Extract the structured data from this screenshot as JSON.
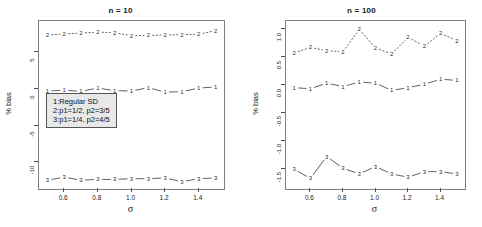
{
  "figure": {
    "ylabel": "% bias",
    "xlabel": "σ",
    "legend": {
      "lines": [
        "1:Regular SD",
        "2:p1=1/2, p2=3/5",
        "3:p1=1/4, p2=4/5"
      ]
    }
  },
  "chart_data": [
    {
      "type": "line",
      "title": "n = 10",
      "xlabel": "σ",
      "ylabel": "% bias",
      "xlim": [
        0.45,
        1.55
      ],
      "ylim": [
        -13.6,
        9.2
      ],
      "xticks": [
        0.6,
        0.8,
        1.0,
        1.2,
        1.4
      ],
      "xticklabels": [
        "0.6",
        "0.8",
        "1.0",
        "1.2",
        "1.4"
      ],
      "yticks": [
        5,
        0,
        -5,
        -10
      ],
      "yticklabels": [
        "5",
        "0",
        "-5",
        "-10"
      ],
      "grid": false,
      "legend_position": "center",
      "x": [
        0.5,
        0.6,
        0.7,
        0.8,
        0.9,
        1.0,
        1.1,
        1.2,
        1.3,
        1.4,
        1.5
      ],
      "series": [
        {
          "name": "1",
          "marker": "1",
          "linestyle": "solid",
          "values": [
            -0.3,
            -0.2,
            -0.35,
            0.1,
            -0.25,
            -0.3,
            0.15,
            -0.45,
            -0.4,
            0.1,
            0.25
          ]
        },
        {
          "name": "2",
          "marker": "2",
          "linestyle": "dashed",
          "values": [
            7.3,
            7.45,
            7.55,
            7.7,
            7.6,
            7.2,
            7.25,
            7.3,
            7.35,
            7.4,
            7.9
          ]
        },
        {
          "name": "3",
          "marker": "3",
          "linestyle": "solid",
          "values": [
            -12.4,
            -12.0,
            -12.4,
            -12.3,
            -12.3,
            -12.2,
            -12.2,
            -12.1,
            -12.6,
            -12.2,
            -12.1
          ]
        }
      ]
    },
    {
      "type": "line",
      "title": "n = 100",
      "xlabel": "σ",
      "ylabel": "% bias",
      "xlim": [
        0.45,
        1.55
      ],
      "ylim": [
        -1.85,
        1.15
      ],
      "xticks": [
        0.6,
        0.8,
        1.0,
        1.2,
        1.4
      ],
      "xticklabels": [
        "0.6",
        "0.8",
        "1.0",
        "1.2",
        "1.4"
      ],
      "yticks": [
        1.0,
        0.5,
        0.0,
        -0.5,
        -1.0,
        -1.5
      ],
      "yticklabels": [
        "1.0",
        "0.5",
        "0.0",
        "-0.5",
        "-1.0",
        "-1.5"
      ],
      "grid": false,
      "legend_position": "none",
      "x": [
        0.5,
        0.6,
        0.7,
        0.8,
        0.9,
        1.0,
        1.1,
        1.2,
        1.3,
        1.4,
        1.5
      ],
      "series": [
        {
          "name": "1",
          "marker": "1",
          "linestyle": "solid",
          "values": [
            -0.04,
            -0.06,
            0.04,
            -0.02,
            0.06,
            0.04,
            -0.09,
            -0.04,
            0.02,
            0.11,
            0.09
          ]
        },
        {
          "name": "2",
          "marker": "2",
          "linestyle": "dashed",
          "values": [
            0.58,
            0.68,
            0.62,
            0.6,
            1.0,
            0.67,
            0.56,
            0.86,
            0.7,
            0.93,
            0.8
          ]
        },
        {
          "name": "3",
          "marker": "3",
          "linestyle": "solid",
          "values": [
            -1.5,
            -1.66,
            -1.27,
            -1.48,
            -1.58,
            -1.45,
            -1.58,
            -1.64,
            -1.54,
            -1.54,
            -1.58
          ]
        }
      ]
    }
  ]
}
